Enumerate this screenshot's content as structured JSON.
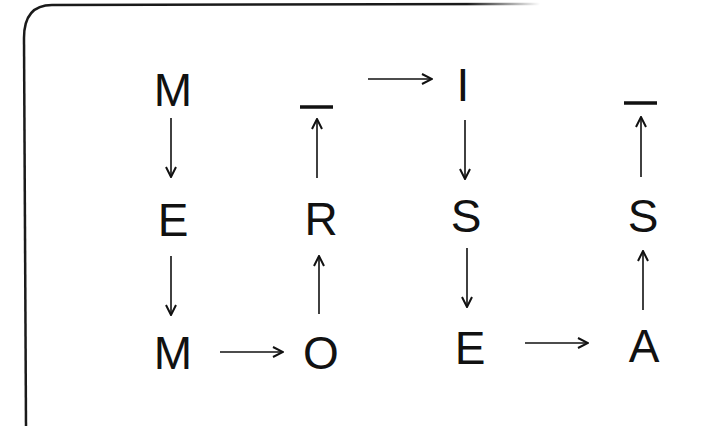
{
  "diagram": {
    "frame": {
      "color": "#1a1a1a",
      "sides_visible": [
        "top",
        "left"
      ],
      "corner": "rounded-top-left"
    },
    "letter_color": "#111111",
    "arrow_color": "#111111",
    "nodes": [
      {
        "id": "m1",
        "label": "M",
        "col": 1,
        "row": 1
      },
      {
        "id": "e1",
        "label": "E",
        "col": 1,
        "row": 2
      },
      {
        "id": "m2",
        "label": "M",
        "col": 1,
        "row": 3
      },
      {
        "id": "o",
        "label": "O",
        "col": 2,
        "row": 3
      },
      {
        "id": "r",
        "label": "R",
        "col": 2,
        "row": 2
      },
      {
        "id": "bar1",
        "label": "—",
        "col": 2,
        "row": 1,
        "kind": "bar"
      },
      {
        "id": "i",
        "label": "I",
        "col": 3,
        "row": 1
      },
      {
        "id": "s1",
        "label": "S",
        "col": 3,
        "row": 2
      },
      {
        "id": "e2",
        "label": "E",
        "col": 3,
        "row": 3
      },
      {
        "id": "a",
        "label": "A",
        "col": 4,
        "row": 3
      },
      {
        "id": "s2",
        "label": "S",
        "col": 4,
        "row": 2
      },
      {
        "id": "bar2",
        "label": "—",
        "col": 4,
        "row": 1,
        "kind": "bar"
      }
    ],
    "edges": [
      {
        "from": "m1",
        "to": "e1",
        "direction": "down"
      },
      {
        "from": "e1",
        "to": "m2",
        "direction": "down"
      },
      {
        "from": "m2",
        "to": "o",
        "direction": "right"
      },
      {
        "from": "o",
        "to": "r",
        "direction": "up"
      },
      {
        "from": "r",
        "to": "bar1",
        "direction": "up"
      },
      {
        "from": "bar1",
        "to": "i",
        "direction": "right"
      },
      {
        "from": "i",
        "to": "s1",
        "direction": "down"
      },
      {
        "from": "s1",
        "to": "e2",
        "direction": "down"
      },
      {
        "from": "e2",
        "to": "a",
        "direction": "right"
      },
      {
        "from": "a",
        "to": "s2",
        "direction": "up"
      },
      {
        "from": "s2",
        "to": "bar2",
        "direction": "up"
      }
    ],
    "reading_sequence": "M E M O R I S E A S",
    "labels": {
      "m1": "M",
      "e1": "E",
      "m2": "M",
      "o": "O",
      "r": "R",
      "i": "I",
      "s1": "S",
      "e2": "E",
      "a": "A",
      "s2": "S"
    }
  }
}
